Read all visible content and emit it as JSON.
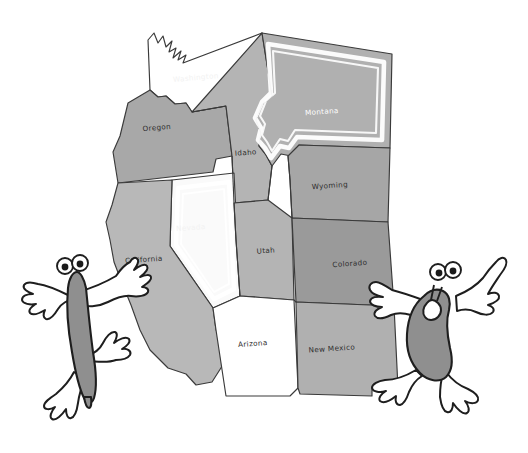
{
  "image": {
    "kind": "illustrated-map",
    "title": "Western United States",
    "background_color": "#ffffff",
    "width": 528,
    "height": 453
  },
  "map": {
    "name": "western-united-states-map",
    "outline_color": "#3a3a3a",
    "states": [
      {
        "id": "washington",
        "label": "Washington",
        "fill": "#ffffff",
        "label_color": "#f2f2f2",
        "label_style": "ghost",
        "highlighted": false,
        "label_x": 196,
        "label_y": 80,
        "label_rotate": -5
      },
      {
        "id": "oregon",
        "label": "Oregon",
        "fill": "#a8a8a8",
        "label_color": "#2e2e2e",
        "label_style": "dark",
        "highlighted": false,
        "label_x": 157,
        "label_y": 130,
        "label_rotate": -5
      },
      {
        "id": "idaho",
        "label": "Idaho",
        "fill": "#b4b4b4",
        "label_color": "#2e2e2e",
        "label_style": "dark",
        "highlighted": false,
        "label_x": 246,
        "label_y": 155,
        "label_rotate": -4
      },
      {
        "id": "montana",
        "label": "Montana",
        "fill": "#b0b0b0",
        "label_color": "#ffffff",
        "label_style": "light",
        "highlighted": true,
        "label_x": 322,
        "label_y": 114,
        "label_rotate": -4
      },
      {
        "id": "wyoming",
        "label": "Wyoming",
        "fill": "#a6a6a6",
        "label_color": "#2e2e2e",
        "label_style": "dark",
        "highlighted": false,
        "label_x": 330,
        "label_y": 188,
        "label_rotate": -4
      },
      {
        "id": "nevada",
        "label": "Nevada",
        "fill": "#fafafa",
        "label_color": "#f0f0f0",
        "label_style": "ghost",
        "highlighted": true,
        "label_x": 191,
        "label_y": 230,
        "label_rotate": -4
      },
      {
        "id": "california",
        "label": "California",
        "fill": "#b8b8b8",
        "label_color": "#2e2e2e",
        "label_style": "dark",
        "highlighted": false,
        "label_x": 144,
        "label_y": 262,
        "label_rotate": -4
      },
      {
        "id": "utah",
        "label": "Utah",
        "fill": "#b4b4b4",
        "label_color": "#2e2e2e",
        "label_style": "dark",
        "highlighted": false,
        "label_x": 266,
        "label_y": 253,
        "label_rotate": -4
      },
      {
        "id": "colorado",
        "label": "Colorado",
        "fill": "#9a9a9a",
        "label_color": "#2e2e2e",
        "label_style": "dark",
        "highlighted": false,
        "label_x": 350,
        "label_y": 266,
        "label_rotate": -4
      },
      {
        "id": "arizona",
        "label": "Arizona",
        "fill": "#ffffff",
        "label_color": "#2e2e2e",
        "label_style": "dark",
        "highlighted": false,
        "label_x": 253,
        "label_y": 346,
        "label_rotate": -4
      },
      {
        "id": "new-mexico",
        "label": "New Mexico",
        "fill": "#b0b0b0",
        "label_color": "#2e2e2e",
        "label_style": "dark",
        "highlighted": false,
        "label_x": 332,
        "label_y": 351,
        "label_rotate": -4
      }
    ]
  },
  "characters": [
    {
      "id": "left-creature",
      "name": "cartoon-blob-left",
      "body_color": "#8f8f8f",
      "outline_color": "#1e1e1e",
      "limb_color": "#ffffff",
      "eye_count": 2,
      "pose": "arms-outstretched"
    },
    {
      "id": "right-creature",
      "name": "cartoon-blob-right",
      "body_color": "#8f8f8f",
      "outline_color": "#1e1e1e",
      "limb_color": "#ffffff",
      "eye_count": 2,
      "pose": "pointing-up"
    }
  ]
}
